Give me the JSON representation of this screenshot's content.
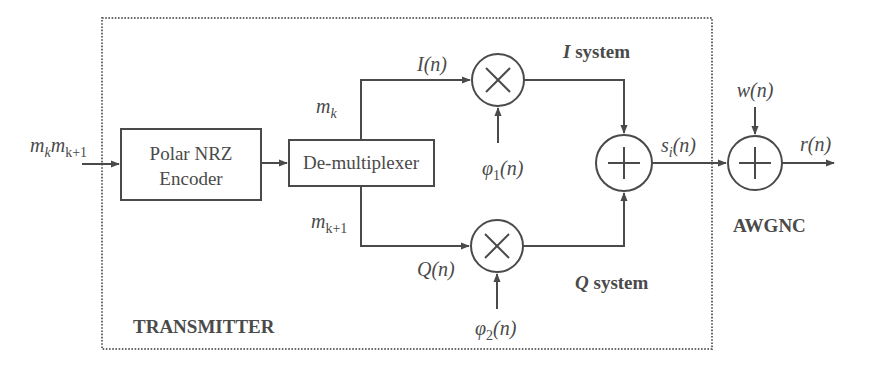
{
  "diagram": {
    "colors": {
      "stroke": "#4a4a4a",
      "background": "#ffffff"
    },
    "regions": {
      "transmitter_label": "TRANSMITTER",
      "channel_label": "AWGNC",
      "i_system_label": {
        "var": "I",
        "rest": " system"
      },
      "q_system_label": {
        "var": "Q",
        "rest": " system"
      }
    },
    "blocks": {
      "encoder": {
        "line1": "Polar NRZ",
        "line2": "Encoder"
      },
      "demux": {
        "label": "De-multiplexer"
      }
    },
    "signals": {
      "input": {
        "m1": "m",
        "sub1": "k",
        "m2": "m",
        "sub2": "k+1"
      },
      "mk": {
        "m": "m",
        "sub": "k"
      },
      "mk1": {
        "m": "m",
        "sub": "k+1"
      },
      "In": "I(n)",
      "Qn": "Q(n)",
      "phi1": {
        "sym": "φ",
        "sub": "1",
        "arg": "(n)"
      },
      "phi2": {
        "sym": "φ",
        "sub": "2",
        "arg": "(n)"
      },
      "si": {
        "s": "s",
        "sub": "i",
        "arg": "(n)"
      },
      "wn": "w(n)",
      "rn": "r(n)"
    },
    "operators": {
      "multiplier_symbol": "×",
      "adder_symbol": "+"
    }
  }
}
